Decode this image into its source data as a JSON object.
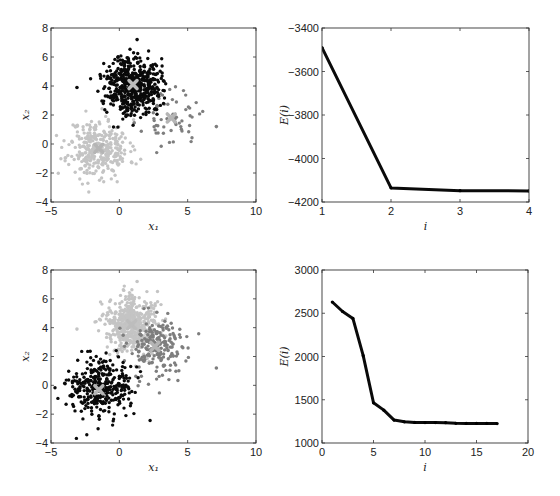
{
  "chart_data": [
    {
      "id": "top-left",
      "type": "scatter",
      "title": "",
      "xlabel": "x₁",
      "ylabel": "x₂",
      "xlim": [
        -5,
        10
      ],
      "ylim": [
        -4,
        8
      ],
      "xticks": [
        -5,
        0,
        5,
        10
      ],
      "yticks": [
        -4,
        -2,
        0,
        2,
        4,
        6,
        8
      ],
      "grid": false,
      "box_px": {
        "left": 51,
        "top": 28,
        "right": 256,
        "bottom": 202
      },
      "clusters": [
        {
          "name": "cluster-light",
          "color": "#c4c4c4",
          "center": [
            -1.5,
            -0.3
          ],
          "spread": [
            1.1,
            1.0
          ],
          "count": 320,
          "seed": 11
        },
        {
          "name": "cluster-mid",
          "color": "#7e7e7e",
          "center": [
            3.8,
            1.7
          ],
          "spread": [
            1.0,
            0.9
          ],
          "count": 60,
          "seed": 23
        },
        {
          "name": "cluster-dark",
          "color": "#0a0a0a",
          "center": [
            1.0,
            4.1
          ],
          "spread": [
            1.0,
            1.0
          ],
          "count": 520,
          "seed": 37
        }
      ],
      "outliers": [
        {
          "x": 7.1,
          "y": 1.2,
          "color": "#7e7e7e"
        },
        {
          "x": -3.1,
          "y": 3.9,
          "color": "#0a0a0a"
        },
        {
          "x": 1.3,
          "y": 7.2,
          "color": "#0a0a0a"
        }
      ],
      "centroids": [
        {
          "x": 1.0,
          "y": 4.1,
          "color": "#bdbdbd"
        },
        {
          "x": 3.8,
          "y": 1.8,
          "color": "#b5b5b5"
        },
        {
          "x": -1.5,
          "y": -0.3,
          "color": "#b5b5b5"
        }
      ]
    },
    {
      "id": "top-right",
      "type": "line",
      "title": "",
      "xlabel": "i",
      "ylabel": "E(i)",
      "xlim": [
        1,
        4
      ],
      "ylim": [
        -4200,
        -3400
      ],
      "xticks": [
        1,
        2,
        3,
        4
      ],
      "yticks": [
        -4200,
        -4000,
        -3800,
        -3600,
        -3400
      ],
      "grid": false,
      "box_px": {
        "left": 322,
        "top": 28,
        "right": 529,
        "bottom": 202
      },
      "x": [
        1,
        2,
        3,
        4
      ],
      "values": [
        -3490,
        -4135,
        -4148,
        -4149
      ],
      "line_color": "#0a0a0a"
    },
    {
      "id": "bottom-left",
      "type": "scatter",
      "title": "",
      "xlabel": "x₁",
      "ylabel": "x₂",
      "xlim": [
        -5,
        10
      ],
      "ylim": [
        -4,
        8
      ],
      "xticks": [
        -5,
        0,
        5,
        10
      ],
      "yticks": [
        -4,
        -2,
        0,
        2,
        4,
        6,
        8
      ],
      "grid": false,
      "box_px": {
        "left": 51,
        "top": 270,
        "right": 256,
        "bottom": 443
      },
      "clusters": [
        {
          "name": "cluster-light",
          "color": "#c4c4c4",
          "center": [
            0.9,
            4.2
          ],
          "spread": [
            1.0,
            1.0
          ],
          "count": 480,
          "seed": 41
        },
        {
          "name": "cluster-mid",
          "color": "#7e7e7e",
          "center": [
            2.8,
            2.6
          ],
          "spread": [
            1.1,
            1.1
          ],
          "count": 200,
          "seed": 53
        },
        {
          "name": "cluster-dark",
          "color": "#0a0a0a",
          "center": [
            -1.5,
            -0.3
          ],
          "spread": [
            1.1,
            1.0
          ],
          "count": 330,
          "seed": 67
        }
      ],
      "outliers": [
        {
          "x": 7.1,
          "y": 1.2,
          "color": "#7e7e7e"
        },
        {
          "x": -3.1,
          "y": 3.9,
          "color": "#c4c4c4"
        },
        {
          "x": 1.3,
          "y": 7.2,
          "color": "#c4c4c4"
        }
      ],
      "centroids": [
        {
          "x": 0.9,
          "y": 4.2,
          "color": "#bdbdbd"
        },
        {
          "x": 2.6,
          "y": 2.7,
          "color": "#b5b5b5"
        },
        {
          "x": -1.5,
          "y": -0.3,
          "color": "#b5b5b5"
        }
      ]
    },
    {
      "id": "bottom-right",
      "type": "line",
      "title": "",
      "xlabel": "i",
      "ylabel": "E(i)",
      "xlim": [
        0,
        20
      ],
      "ylim": [
        1000,
        3000
      ],
      "xticks": [
        0,
        5,
        10,
        15,
        20
      ],
      "yticks": [
        1000,
        1500,
        2000,
        2500,
        3000
      ],
      "grid": false,
      "box_px": {
        "left": 322,
        "top": 270,
        "right": 528,
        "bottom": 443
      },
      "x": [
        1,
        2,
        3,
        4,
        5,
        6,
        7,
        8,
        9,
        10,
        11,
        12,
        13,
        14,
        15,
        16,
        17
      ],
      "values": [
        2630,
        2520,
        2440,
        2010,
        1465,
        1380,
        1265,
        1245,
        1238,
        1236,
        1236,
        1235,
        1228,
        1226,
        1226,
        1226,
        1225
      ],
      "line_color": "#0a0a0a"
    }
  ]
}
